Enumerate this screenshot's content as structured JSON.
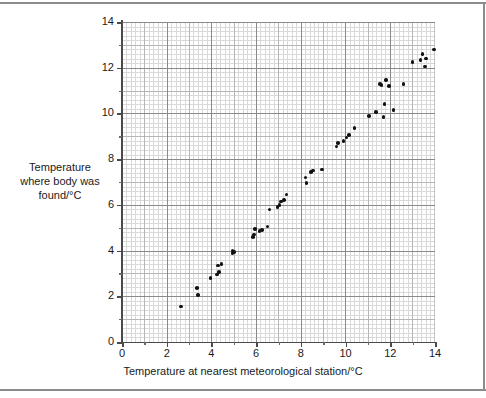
{
  "chart_data": {
    "type": "scatter",
    "title": "",
    "xlabel": "Temperature at nearest meteorological station/°C",
    "ylabel": "Temperature where body was found/°C",
    "xlim": [
      0,
      14
    ],
    "ylim": [
      0,
      14
    ],
    "xticks": [
      0,
      2,
      4,
      6,
      8,
      10,
      12,
      14
    ],
    "yticks": [
      0,
      2,
      4,
      6,
      8,
      10,
      12,
      14
    ],
    "xtick_labels": [
      "0",
      "2",
      "4",
      "6",
      "8",
      "10",
      "12",
      "14"
    ],
    "ytick_labels": [
      "0",
      "2",
      "4",
      "6",
      "8",
      "10",
      "12",
      "14"
    ],
    "grid": true,
    "grid_minor_step": 0.2,
    "grid_unit_step": 1.0,
    "grid_major_step": 2.0,
    "legend": null,
    "marker": "filled-circle",
    "marker_color": "#111111",
    "points": [
      [
        2.65,
        1.55
      ],
      [
        3.35,
        2.35
      ],
      [
        3.4,
        2.05
      ],
      [
        3.95,
        2.8
      ],
      [
        4.25,
        2.95
      ],
      [
        4.35,
        3.05
      ],
      [
        4.3,
        3.35
      ],
      [
        4.45,
        3.4
      ],
      [
        4.95,
        3.9
      ],
      [
        4.95,
        4.0
      ],
      [
        5.0,
        3.95
      ],
      [
        5.85,
        4.6
      ],
      [
        5.9,
        4.7
      ],
      [
        5.95,
        4.95
      ],
      [
        6.15,
        4.85
      ],
      [
        6.25,
        4.9
      ],
      [
        6.5,
        5.05
      ],
      [
        6.6,
        5.8
      ],
      [
        6.95,
        5.9
      ],
      [
        7.05,
        6.0
      ],
      [
        7.1,
        6.15
      ],
      [
        7.25,
        6.2
      ],
      [
        7.35,
        6.45
      ],
      [
        8.2,
        7.2
      ],
      [
        8.25,
        6.95
      ],
      [
        8.45,
        7.45
      ],
      [
        8.55,
        7.5
      ],
      [
        8.95,
        7.55
      ],
      [
        9.6,
        8.55
      ],
      [
        9.65,
        8.7
      ],
      [
        9.9,
        8.8
      ],
      [
        10.05,
        8.95
      ],
      [
        10.15,
        9.05
      ],
      [
        10.4,
        9.35
      ],
      [
        11.05,
        9.9
      ],
      [
        11.35,
        10.05
      ],
      [
        11.55,
        11.3
      ],
      [
        11.6,
        11.25
      ],
      [
        11.7,
        9.85
      ],
      [
        11.75,
        10.4
      ],
      [
        11.8,
        11.45
      ],
      [
        11.95,
        11.2
      ],
      [
        12.15,
        10.15
      ],
      [
        12.6,
        11.3
      ],
      [
        13.0,
        12.25
      ],
      [
        13.35,
        12.35
      ],
      [
        13.45,
        12.6
      ],
      [
        13.55,
        12.05
      ],
      [
        13.6,
        12.4
      ],
      [
        13.95,
        12.8
      ]
    ]
  },
  "axes": {
    "x_label": "Temperature at nearest meteorological station/°C",
    "y_label": "Temperature where body was found/°C"
  }
}
